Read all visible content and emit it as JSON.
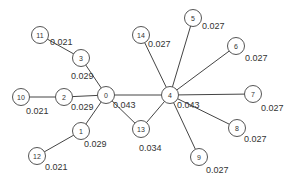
{
  "diagram": {
    "type": "graph",
    "nodes": [
      {
        "id": "0",
        "x": 106,
        "y": 95,
        "value": "0.043",
        "lx": 113,
        "ly": 100
      },
      {
        "id": "1",
        "x": 81,
        "y": 131,
        "value": "0.029",
        "lx": 84,
        "ly": 139
      },
      {
        "id": "2",
        "x": 64,
        "y": 97,
        "value": "0.029",
        "lx": 71,
        "ly": 102
      },
      {
        "id": "3",
        "x": 81,
        "y": 58,
        "value": "0.029",
        "lx": 71,
        "ly": 71
      },
      {
        "id": "4",
        "x": 170,
        "y": 95,
        "value": "0.043",
        "lx": 177,
        "ly": 100
      },
      {
        "id": "5",
        "x": 193,
        "y": 18,
        "value": "0.027",
        "lx": 202,
        "ly": 21
      },
      {
        "id": "6",
        "x": 236,
        "y": 46,
        "value": "0.027",
        "lx": 245,
        "ly": 53
      },
      {
        "id": "7",
        "x": 253,
        "y": 94,
        "value": "0.027",
        "lx": 261,
        "ly": 103
      },
      {
        "id": "8",
        "x": 237,
        "y": 128,
        "value": "0.027",
        "lx": 244,
        "ly": 134
      },
      {
        "id": "9",
        "x": 199,
        "y": 157,
        "value": "0.027",
        "lx": 206,
        "ly": 165
      },
      {
        "id": "10",
        "x": 21,
        "y": 97,
        "value": "0.021",
        "lx": 26,
        "ly": 106
      },
      {
        "id": "11",
        "x": 40,
        "y": 35,
        "value": "0.021",
        "lx": 50,
        "ly": 37
      },
      {
        "id": "12",
        "x": 37,
        "y": 156,
        "value": "0.021",
        "lx": 45,
        "ly": 162
      },
      {
        "id": "13",
        "x": 141,
        "y": 129,
        "value": "0.034",
        "lx": 139,
        "ly": 143
      },
      {
        "id": "14",
        "x": 141,
        "y": 35,
        "value": "0.027",
        "lx": 148,
        "ly": 39
      }
    ],
    "edges": [
      [
        "0",
        "1"
      ],
      [
        "0",
        "2"
      ],
      [
        "0",
        "3"
      ],
      [
        "0",
        "4"
      ],
      [
        "0",
        "13"
      ],
      [
        "1",
        "12"
      ],
      [
        "2",
        "10"
      ],
      [
        "3",
        "11"
      ],
      [
        "4",
        "5"
      ],
      [
        "4",
        "6"
      ],
      [
        "4",
        "7"
      ],
      [
        "4",
        "8"
      ],
      [
        "4",
        "9"
      ],
      [
        "4",
        "13"
      ],
      [
        "4",
        "14"
      ]
    ],
    "colors": {
      "edge": "#444444",
      "node_border": "#555555",
      "text": "#333333"
    }
  }
}
